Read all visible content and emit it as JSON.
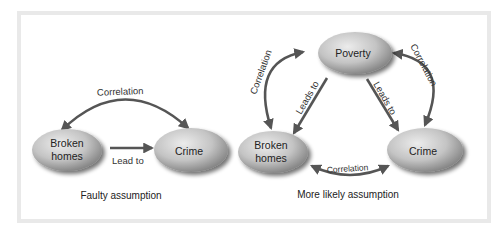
{
  "colors": {
    "frame_border": "#e9e9e9",
    "arrow": "#555555",
    "node_fill_light": "#e0e0e0",
    "node_fill_dark": "#8a8a8a",
    "text": "#222222"
  },
  "left_panel": {
    "caption": "Faulty assumption",
    "nodes": {
      "broken_homes": {
        "line1": "Broken",
        "line2": "homes"
      },
      "crime": {
        "label": "Crime"
      }
    },
    "edges": {
      "correlation": {
        "label": "Correlation",
        "type": "bidirectional-curved"
      },
      "lead_to": {
        "label": "Lead to",
        "type": "directed",
        "from": "Broken homes",
        "to": "Crime"
      }
    }
  },
  "right_panel": {
    "caption": "More likely assumption",
    "nodes": {
      "poverty": {
        "label": "Poverty"
      },
      "broken_homes": {
        "line1": "Broken",
        "line2": "homes"
      },
      "crime": {
        "label": "Crime"
      }
    },
    "edges": {
      "correlation_left": {
        "label": "Correlation",
        "type": "bidirectional-curved",
        "between": [
          "Poverty",
          "Broken homes"
        ]
      },
      "correlation_right": {
        "label": "Correlation",
        "type": "bidirectional-curved",
        "between": [
          "Poverty",
          "Crime"
        ]
      },
      "correlation_bottom": {
        "label": "Correlation",
        "type": "bidirectional-curved",
        "between": [
          "Broken homes",
          "Crime"
        ]
      },
      "leads_to_left": {
        "label": "Leads to",
        "type": "directed",
        "from": "Poverty",
        "to": "Broken homes"
      },
      "leads_to_right": {
        "label": "Leads to",
        "type": "directed",
        "from": "Poverty",
        "to": "Crime"
      }
    }
  }
}
